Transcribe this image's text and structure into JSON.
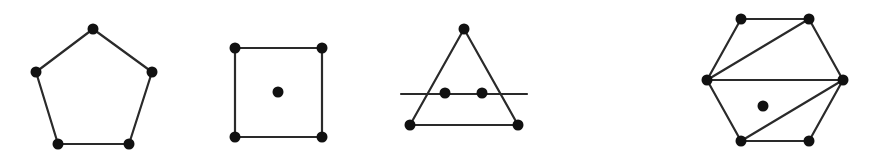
{
  "style": {
    "stroke": "#2a2a2a",
    "vertex_fill": "#111111",
    "vertex_radius": 5.5,
    "background": "#ffffff"
  },
  "figures": [
    {
      "name": "pentagon",
      "vertices": [
        [
          93,
          29
        ],
        [
          152,
          72
        ],
        [
          129,
          144
        ],
        [
          58,
          144
        ],
        [
          36,
          72
        ]
      ],
      "edges": [
        [
          0,
          1
        ],
        [
          1,
          2
        ],
        [
          2,
          3
        ],
        [
          3,
          4
        ],
        [
          4,
          0
        ]
      ],
      "extra_lines": [],
      "points": []
    },
    {
      "name": "square-with-center-point",
      "vertices": [
        [
          235,
          48
        ],
        [
          322,
          48
        ],
        [
          322,
          137
        ],
        [
          235,
          137
        ]
      ],
      "edges": [
        [
          0,
          1
        ],
        [
          1,
          2
        ],
        [
          2,
          3
        ],
        [
          3,
          0
        ]
      ],
      "extra_lines": [],
      "points": [
        [
          278,
          92
        ]
      ]
    },
    {
      "name": "triangle-with-crossing-line",
      "vertices": [
        [
          464,
          29
        ],
        [
          518,
          125
        ],
        [
          410,
          125
        ]
      ],
      "edges": [
        [
          0,
          1
        ],
        [
          1,
          2
        ],
        [
          2,
          0
        ]
      ],
      "extra_lines": [
        [
          [
            401,
            94
          ],
          [
            527,
            94
          ]
        ]
      ],
      "points": [
        [
          445,
          93
        ],
        [
          482,
          93
        ]
      ]
    },
    {
      "name": "triangulated-hexagon",
      "vertices": [
        [
          741,
          19
        ],
        [
          809,
          19
        ],
        [
          843,
          80
        ],
        [
          809,
          141
        ],
        [
          741,
          141
        ],
        [
          707,
          80
        ]
      ],
      "edges": [
        [
          0,
          1
        ],
        [
          1,
          2
        ],
        [
          2,
          3
        ],
        [
          3,
          4
        ],
        [
          4,
          5
        ],
        [
          5,
          0
        ],
        [
          5,
          1
        ],
        [
          5,
          2
        ],
        [
          2,
          4
        ]
      ],
      "extra_lines": [],
      "points": [
        [
          763,
          106
        ]
      ]
    }
  ]
}
